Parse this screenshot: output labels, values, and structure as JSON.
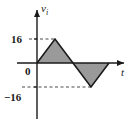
{
  "figure": {
    "background_color": "#ffffff",
    "line_color": "#1a1a1a",
    "fill_color": "#9a9a9a",
    "guide_color": "#6b6b6b"
  },
  "axes": {
    "y_axis_title": "v",
    "y_axis_subscript": "i",
    "x_axis_title": "t",
    "y_tick_positive": "16",
    "y_tick_origin": "0",
    "y_tick_negative": "−16"
  },
  "chart_data": {
    "type": "line",
    "title": "",
    "subtitle": "",
    "xlabel": "t",
    "ylabel": "v_i",
    "grid": false,
    "legend": null,
    "annotations": [
      "Dashed guide line from +16 tick to positive triangle peak",
      "Dashed guide line from −16 tick to negative triangle trough"
    ],
    "xlim": [
      0,
      4
    ],
    "ylim": [
      -16,
      16
    ],
    "ytick_labels": [
      "16",
      "0",
      "−16"
    ],
    "ytick_values": [
      16,
      0,
      -16
    ],
    "xtick_labels": [],
    "xtick_values": [],
    "fill_to_zero": true,
    "series": [
      {
        "name": "v_i",
        "x": [
          0,
          1,
          2,
          3,
          4
        ],
        "values": [
          0,
          16,
          0,
          -16,
          0
        ]
      }
    ]
  }
}
